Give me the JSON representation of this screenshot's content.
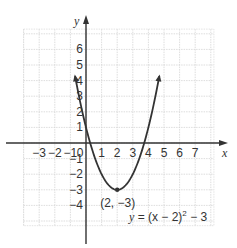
{
  "chart_data": {
    "type": "line",
    "title": "",
    "xlabel": "x",
    "ylabel": "y",
    "xlim": [
      -4,
      8.2
    ],
    "ylim": [
      -5.3,
      7.3
    ],
    "grid": true,
    "x_ticks": [
      -3,
      -2,
      -1,
      0,
      1,
      2,
      3,
      4,
      5,
      6,
      7
    ],
    "x_tick_labels": [
      "−3",
      "−2",
      "−1",
      "0",
      "1",
      "2",
      "3",
      "4",
      "5",
      "6",
      "7"
    ],
    "y_ticks": [
      6,
      5,
      4,
      3,
      2,
      1,
      -1,
      -2,
      -3,
      -4
    ],
    "y_tick_labels": [
      "6",
      "5",
      "4",
      "3",
      "2",
      "1",
      "−1",
      "−2",
      "−3",
      "−4"
    ],
    "series": [
      {
        "name": "y = (x − 2)^2 − 3",
        "function": "(x-2)^2-3",
        "x": [
          -0.7,
          0,
          1,
          2,
          3,
          4,
          4.7
        ],
        "values": [
          4.29,
          1,
          -2,
          -3,
          -2,
          1,
          4.29
        ]
      }
    ],
    "points": [
      {
        "x": 2,
        "y": -3,
        "label": "(2, −3)"
      }
    ],
    "annotations": [
      {
        "text": "(2, −3)",
        "position": "below vertex"
      },
      {
        "text": "y = (x − 2)² − 3",
        "position": "bottom right"
      }
    ],
    "legend": "none"
  },
  "labels": {
    "x_axis": "x",
    "y_axis": "y",
    "vertex": "(2, −3)",
    "equation_y": "y",
    "equation_rest": " = (x − 2)",
    "equation_exp": "2",
    "equation_tail": " − 3"
  }
}
